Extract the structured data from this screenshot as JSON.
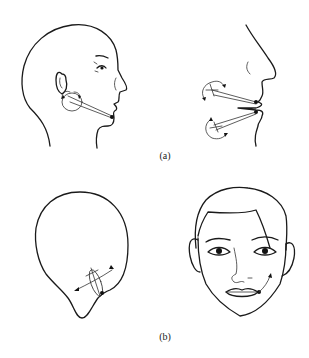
{
  "figure": {
    "panels": [
      {
        "id": "a",
        "label": "(a)",
        "views": [
          "side-profile-head",
          "lips-profile-closeup"
        ],
        "annotations": [
          "jaw-muscle-vector-arrows",
          "upper-lip-vector-arrows",
          "lower-lip-vector-arrows"
        ]
      },
      {
        "id": "b",
        "label": "(b)",
        "views": [
          "head-outline-top-view",
          "frontal-face"
        ],
        "annotations": [
          "cheek-crossed-arrows",
          "mouth-corner-curved-arrow"
        ]
      }
    ],
    "colors": {
      "line": "#1a1a1a",
      "background": "#ffffff"
    }
  }
}
